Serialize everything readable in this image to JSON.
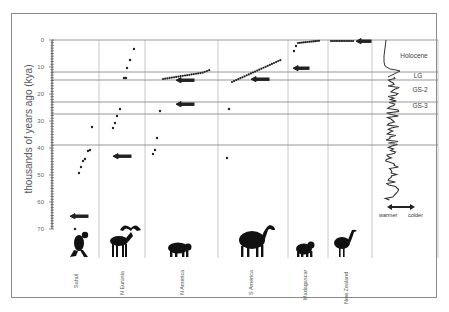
{
  "chart_data": {
    "type": "scatter",
    "title": "",
    "ylabel": "thousands of years ago (kya)",
    "xlabel": "",
    "ylim": [
      0,
      70
    ],
    "y_ticks": [
      0,
      10,
      20,
      30,
      40,
      50,
      60,
      70
    ],
    "regions": [
      "Sahul",
      "N Eurasia",
      "N America",
      "S America",
      "Madagascar",
      "New Zealand"
    ],
    "climate_bands": [
      {
        "label": "Holocene",
        "from": 0,
        "to": 11.7
      },
      {
        "label": "LG",
        "from": 11.7,
        "to": 14.7
      },
      {
        "label": "GS-2",
        "from": 14.7,
        "to": 23
      },
      {
        "label": "GS-3",
        "from": 23,
        "to": 27.5
      }
    ],
    "horizontal_lines_kya": [
      11.7,
      14.7,
      23,
      27.5,
      39
    ],
    "series": [
      {
        "name": "Sahul",
        "extinction_kya": [
          32,
          40.5,
          40.8,
          44.5,
          45,
          47,
          49.5,
          69
        ],
        "human_arrival_kya": 65
      },
      {
        "name": "N Eurasia",
        "extinction_kya": [
          3.5,
          7.5,
          10.5,
          14,
          14.2,
          25.5,
          28,
          30.5,
          32.5
        ],
        "human_arrival_kya": 43
      },
      {
        "name": "N America",
        "extinction_kya": [
          11.5,
          11.8,
          12,
          12.2,
          12.4,
          12.6,
          12.8,
          13,
          13.2,
          13.4,
          13.6,
          13.8,
          14,
          14.2,
          14.5,
          26,
          35.5,
          40.5,
          42
        ],
        "human_arrival_kya": [
          15,
          23.5
        ]
      },
      {
        "name": "S America",
        "extinction_kya": [
          10,
          10.5,
          11,
          11.5,
          12,
          12.5,
          13,
          13.3,
          13.6,
          14,
          14.5,
          15.5,
          16,
          25.5,
          44
        ],
        "human_arrival_kya": 14.5
      },
      {
        "name": "Madagascar",
        "extinction_kya": [
          0.8,
          1,
          1.2,
          1.4,
          1.6,
          1.8,
          2,
          2.5,
          4,
          6.5
        ],
        "human_arrival_kya": 10.5
      },
      {
        "name": "New Zealand",
        "extinction_kya": [
          0.5,
          0.55,
          0.6,
          0.65,
          0.7,
          0.75
        ],
        "human_arrival_kya": 0.7
      }
    ],
    "climate_curve_legend": {
      "left": "warmer",
      "right": "colder"
    }
  },
  "axis": {
    "label": "thousands of years ago (kya)",
    "ticks": [
      "0",
      "10",
      "20",
      "30",
      "40",
      "50",
      "60",
      "70"
    ]
  },
  "regions": [
    "Sahul",
    "N Eurasia",
    "N America",
    "S America",
    "Madagascar",
    "New Zealand"
  ],
  "bands": {
    "holocene": "Holocene",
    "lg": "LG",
    "gs2": "GS-2",
    "gs3": "GS-3"
  },
  "legend": {
    "warmer": "warmer",
    "colder": "colder"
  },
  "animals": [
    "marsupial-lion-icon",
    "irish-elk-icon",
    "sabertooth-icon",
    "macrauchenia-icon",
    "giant-lemur-icon",
    "moa-icon"
  ]
}
